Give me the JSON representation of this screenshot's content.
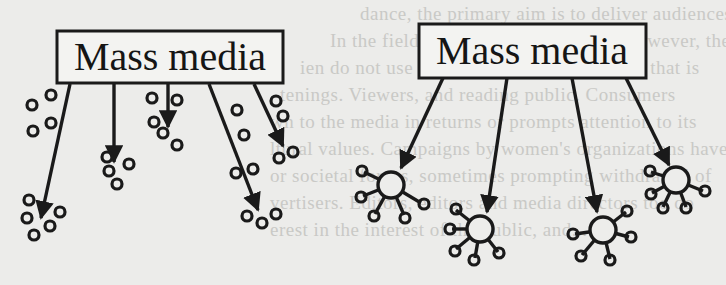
{
  "figure": {
    "left_panel": {
      "box_label": "Mass media",
      "model": "isolated-individuals",
      "arrow_count": 5,
      "recipient_style": "scattered small circles"
    },
    "right_panel": {
      "box_label": "Mass media",
      "model": "interpersonal-networks",
      "arrow_count": 4,
      "recipient_style": "hub circles with small linked circles"
    }
  },
  "background_text": {
    "lines": [
      "dance, the primary aim is to deliver audiences to advertisers",
      "In the field of mass communication, however, the content and",
      "ien do not use the media, it is the audience that is",
      "tenings. Viewers, and reading public. Consumers",
      "wn to the media in returns or prompts attention to its",
      "ltural values. Campaigns by women's organizations have",
      "or societal forces, sometimes prompting withdrawal of",
      "vertisers. Editors, editors and media directors too do",
      "erest in the interest of the public, and..."
    ]
  }
}
